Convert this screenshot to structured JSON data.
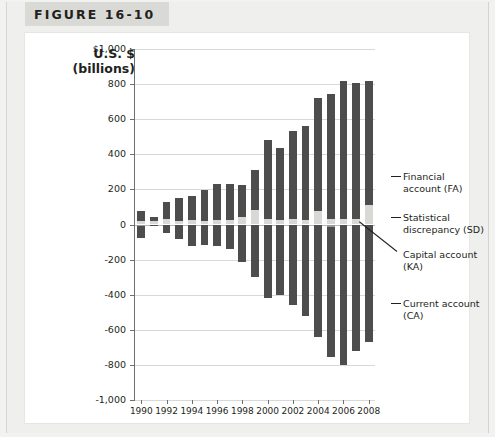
{
  "figure": {
    "label": "FIGURE 16-10"
  },
  "axis": {
    "title_line1": "U.S. $",
    "title_line2": "(billions)"
  },
  "annotations": [
    {
      "id": "fa",
      "line1": "Financial",
      "line2": "account (FA)"
    },
    {
      "id": "sd",
      "line1": "Statistical",
      "line2": "discrepancy (SD)"
    },
    {
      "id": "ka",
      "line1": "Capital account",
      "line2": "(KA)"
    },
    {
      "id": "ca",
      "line1": "Current account",
      "line2": "(CA)"
    }
  ],
  "colors": {
    "financial_account": "#4d4d4d",
    "statistical_discrepancy": "#d8d8d6",
    "capital_account": "#9a9a98",
    "current_account": "#4d4d4d",
    "gridline": "#d8d8d6",
    "axis": "#6f6f6d",
    "header_band": "#d9d9d6",
    "page_background": "#efefed"
  },
  "chart_data": {
    "type": "bar",
    "title": "FIGURE 16-10",
    "subtype": "stacked-diverging",
    "xlabel": "",
    "ylabel": "U.S. $ (billions)",
    "ylim": [
      -1000,
      1000
    ],
    "ytick_values": [
      1000,
      800,
      600,
      400,
      200,
      0,
      -200,
      -400,
      -600,
      -800,
      -1000
    ],
    "ytick_labels": [
      "$1,000",
      "800",
      "600",
      "400",
      "200",
      "0",
      "-200",
      "-400",
      "-600",
      "-800",
      "-1,000"
    ],
    "grid": true,
    "legend_position": "right-annotations",
    "x": [
      1990,
      1991,
      1992,
      1993,
      1994,
      1995,
      1996,
      1997,
      1998,
      1999,
      2000,
      2001,
      2002,
      2003,
      2004,
      2005,
      2006,
      2007,
      2008
    ],
    "xtick_labels": [
      "1990",
      "1992",
      "1994",
      "1996",
      "1998",
      "2000",
      "2002",
      "2004",
      "2006",
      "2008"
    ],
    "xtick_values": [
      1990,
      1992,
      1994,
      1996,
      1998,
      2000,
      2002,
      2004,
      2006,
      2008
    ],
    "series": [
      {
        "name": "Financial account (FA)",
        "key": "FA",
        "color": "#4d4d4d",
        "values": [
          59,
          20,
          97,
          129,
          138,
          173,
          203,
          205,
          179,
          227,
          451,
          406,
          501,
          533,
          644,
          711,
          786,
          774,
          707
        ]
      },
      {
        "name": "Statistical discrepancy (SD)",
        "key": "SD",
        "color": "#d8d8d6",
        "values": [
          20,
          20,
          30,
          22,
          25,
          22,
          25,
          25,
          45,
          85,
          30,
          28,
          30,
          27,
          75,
          30,
          30,
          30,
          110
        ]
      },
      {
        "name": "Capital account (KA)",
        "key": "KA",
        "color": "#9a9a98",
        "values": [
          7,
          5,
          1,
          1,
          1,
          1,
          1,
          1,
          1,
          5,
          1,
          1,
          1,
          3,
          2,
          13,
          4,
          2,
          1
        ]
      },
      {
        "name": "Current account (CA)",
        "key": "CA",
        "color": "#4d4d4d",
        "values": [
          -79,
          -3,
          -51,
          -85,
          -122,
          -114,
          -125,
          -141,
          -215,
          -301,
          -417,
          -399,
          -459,
          -522,
          -640,
          -755,
          -800,
          -718,
          -669
        ]
      }
    ]
  }
}
